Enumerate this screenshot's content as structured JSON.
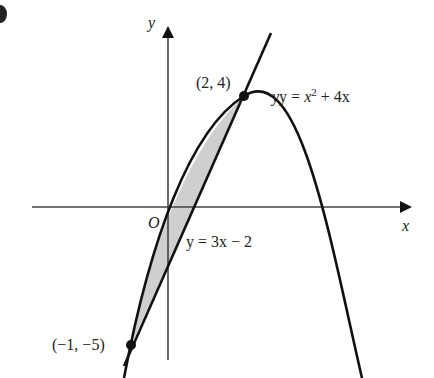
{
  "figure": {
    "axis_labels": {
      "x": "x",
      "y": "y",
      "origin": "O"
    },
    "points": [
      {
        "label": "(2, 4)",
        "x": 2,
        "y": 4
      },
      {
        "label": "(−1, −5)",
        "x": -1,
        "y": -5
      }
    ],
    "curves": {
      "parabola": {
        "label_prefix": "y = ",
        "label_var": "x",
        "label_exp": "2",
        "label_rest": " + 4x"
      },
      "line": {
        "label": "y = 3x − 2"
      }
    },
    "shaded_region": "between line and parabola from x = −1 to x = 2",
    "colors": {
      "ink": "#111111",
      "shade": "#cfcfcf",
      "axis": "#444444"
    }
  }
}
